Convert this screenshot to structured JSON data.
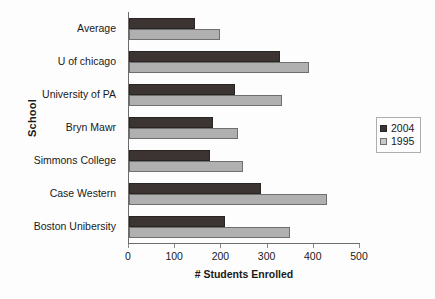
{
  "chart_data": {
    "type": "bar",
    "orientation": "horizontal",
    "title": "",
    "xlabel": "# Students Enrolled",
    "ylabel": "School",
    "categories": [
      "Average",
      "U of chicago",
      "University of PA",
      "Bryn Mawr",
      "Simmons College",
      "Case Western",
      "Boston Unibersity"
    ],
    "series": [
      {
        "name": "2004",
        "color": "#3b3433",
        "values": [
          143,
          327,
          229,
          182,
          175,
          286,
          208
        ]
      },
      {
        "name": "1995",
        "color": "#b0b0b0",
        "values": [
          197,
          390,
          331,
          236,
          246,
          428,
          348
        ]
      }
    ],
    "xlim": [
      0,
      500
    ],
    "xticks": [
      0,
      100,
      200,
      300,
      400,
      500
    ],
    "xtick_labels": [
      "0",
      "100",
      "200",
      "300",
      "400",
      "500"
    ],
    "grid": false,
    "legend_position": "right"
  },
  "legend": {
    "entries": [
      {
        "label": "2004"
      },
      {
        "label": "1995"
      }
    ]
  }
}
